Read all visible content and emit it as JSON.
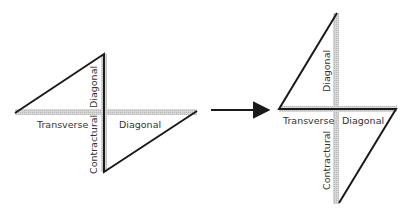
{
  "diagram": {
    "type": "force-transformation",
    "colors": {
      "line": "#1a1a1a",
      "bar": "#c9c9c9",
      "text": "#333333",
      "background": "#ffffff"
    },
    "left_figure": {
      "labels": {
        "diagonal_vertical": "Diagonal",
        "transverse": "Transverse",
        "contractural": "Contractural",
        "diagonal_horizontal": "Diagonal"
      }
    },
    "arrow": {
      "direction": "right"
    },
    "right_figure": {
      "labels": {
        "diagonal_vertical": "Diagonal",
        "transverse": "Transverse",
        "contractural": "Contractural",
        "diagonal_horizontal": "Diagonal"
      }
    }
  }
}
